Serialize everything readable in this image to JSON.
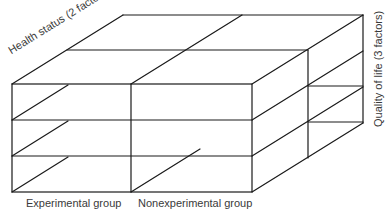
{
  "diagram": {
    "type": "3d-factorial-design-cube",
    "axes": {
      "depth": {
        "label": "Health status (2 factors)",
        "levels": 2
      },
      "vertical": {
        "label": "Quality of life (3 factors)",
        "levels": 3
      },
      "horizontal": {
        "labels": [
          "Experimental group",
          "Nonexperimental group"
        ],
        "levels": 2
      }
    },
    "line_color": "#1a1a1a",
    "text_color": "#3a3a3a"
  }
}
